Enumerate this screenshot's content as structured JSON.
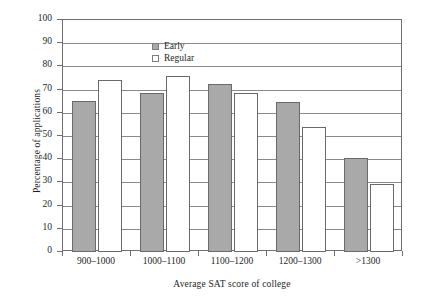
{
  "chart_data": {
    "type": "bar",
    "title": "",
    "xlabel": "Average SAT score of college",
    "ylabel": "Percentage of applications",
    "categories": [
      "900–1000",
      "1000–1100",
      "1100–1200",
      "1200–1300",
      ">1300"
    ],
    "series": [
      {
        "name": "Early",
        "color": "#a9a9a9",
        "values": [
          65,
          68.5,
          72.5,
          64.5,
          40.5
        ]
      },
      {
        "name": "Regular",
        "color": "#ffffff",
        "values": [
          74,
          76,
          68.5,
          54,
          29.5
        ]
      }
    ],
    "ylim": [
      0,
      100
    ],
    "ytick_labels": [
      "0",
      "10",
      "20",
      "30",
      "40",
      "50",
      "60",
      "70",
      "80",
      "90",
      "100"
    ],
    "ytick_values": [
      0,
      10,
      20,
      30,
      40,
      50,
      60,
      70,
      80,
      90,
      100
    ],
    "grid": "horizontal",
    "legend_position": "top-left",
    "legend": [
      {
        "label": "Early",
        "swatch": "filled-gray-square"
      },
      {
        "label": "Regular",
        "swatch": "open-white-square"
      }
    ]
  }
}
